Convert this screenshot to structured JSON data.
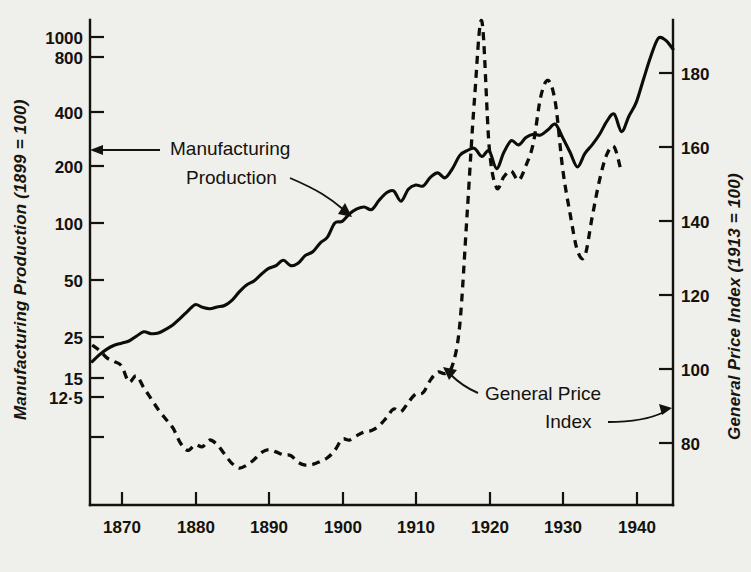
{
  "chart_data": {
    "type": "line",
    "title": "",
    "xlabel": "",
    "ylabel": "Manufacturing Production (1899 = 100)",
    "y2label": "General Price Index (1913 = 100)",
    "xlim": [
      1865.7,
      1945.0
    ],
    "x_ticks": [
      1870,
      1880,
      1890,
      1900,
      1910,
      1920,
      1930,
      1940
    ],
    "x_tick_labels": [
      "1870",
      "1880",
      "1890",
      "1900",
      "1910",
      "1920",
      "1930",
      "1940"
    ],
    "y_scale": "log",
    "ylim": [
      9.0,
      1300
    ],
    "y_ticks": [
      12.5,
      15,
      25,
      50,
      100,
      200,
      400,
      800,
      1000
    ],
    "y_tick_labels": [
      "12·5",
      "15",
      "25",
      "50",
      "100",
      "200",
      "400",
      "800",
      "1000"
    ],
    "y2_scale": "linear",
    "y2lim": [
      70,
      200
    ],
    "y2_ticks": [
      80,
      100,
      120,
      140,
      160,
      180
    ],
    "y2_tick_labels": [
      "80",
      "100",
      "120",
      "140",
      "160",
      "180"
    ],
    "grid": false,
    "legend": "annotated-inline",
    "series": [
      {
        "name": "Manufacturing Production",
        "axis": "left",
        "style": "solid",
        "x": [
          1866,
          1867,
          1868,
          1869,
          1870,
          1871,
          1872,
          1873,
          1874,
          1875,
          1876,
          1877,
          1878,
          1879,
          1880,
          1881,
          1882,
          1883,
          1884,
          1885,
          1886,
          1887,
          1888,
          1889,
          1890,
          1891,
          1892,
          1893,
          1894,
          1895,
          1896,
          1897,
          1898,
          1899,
          1900,
          1901,
          1902,
          1903,
          1904,
          1905,
          1906,
          1907,
          1908,
          1909,
          1910,
          1911,
          1912,
          1913,
          1914,
          1915,
          1916,
          1917,
          1918,
          1919,
          1920,
          1921,
          1922,
          1923,
          1924,
          1925,
          1926,
          1927,
          1928,
          1929,
          1930,
          1931,
          1932,
          1933,
          1934,
          1935,
          1936,
          1937,
          1938,
          1939,
          1940,
          1941,
          1942,
          1943,
          1944,
          1945
        ],
        "y": [
          18.0,
          19.6,
          21.0,
          22.0,
          22.6,
          23.2,
          24.6,
          26.0,
          25.4,
          25.6,
          26.8,
          28.4,
          30.8,
          33.6,
          36.4,
          35.2,
          34.6,
          35.4,
          36.0,
          38.4,
          42.6,
          46.4,
          48.8,
          53.0,
          57.0,
          59.0,
          63.0,
          59.0,
          60.8,
          67.0,
          70.0,
          78.0,
          84.0,
          100.0,
          102.0,
          112.0,
          119.0,
          122.0,
          118.0,
          132.0,
          145.0,
          149.0,
          131.0,
          152.0,
          160.0,
          158.0,
          176.0,
          186.0,
          175.0,
          196.0,
          231.0,
          245.0,
          252.0,
          228.0,
          244.0,
          196.0,
          240.0,
          277.0,
          263.0,
          288.0,
          300.0,
          297.0,
          317.0,
          340.0,
          287.0,
          240.0,
          200.0,
          236.0,
          263.0,
          299.0,
          352.0,
          385.0,
          310.0,
          375.0,
          445.0,
          595.0,
          790.0,
          985.0,
          960.0,
          860.0
        ]
      },
      {
        "name": "General Price Index",
        "axis": "right",
        "style": "dashed",
        "x": [
          1866,
          1867,
          1868,
          1869,
          1870,
          1871,
          1872,
          1873,
          1874,
          1875,
          1876,
          1877,
          1878,
          1879,
          1880,
          1881,
          1882,
          1883,
          1884,
          1885,
          1886,
          1887,
          1888,
          1889,
          1890,
          1891,
          1892,
          1893,
          1894,
          1895,
          1896,
          1897,
          1898,
          1899,
          1900,
          1901,
          1902,
          1903,
          1904,
          1905,
          1906,
          1907,
          1908,
          1909,
          1910,
          1911,
          1912,
          1913,
          1914,
          1915,
          1916,
          1917,
          1918,
          1919,
          1920,
          1921,
          1922,
          1923,
          1924,
          1925,
          1926,
          1927,
          1928,
          1929,
          1930,
          1931,
          1932,
          1933,
          1934,
          1935,
          1936,
          1937,
          1938
        ],
        "y": [
          106.5,
          105.0,
          103.0,
          102.0,
          100.8,
          96.5,
          98.2,
          95.0,
          92.0,
          89.0,
          86.5,
          84.0,
          80.0,
          78.0,
          79.5,
          79.0,
          80.8,
          79.5,
          77.0,
          74.5,
          73.2,
          74.0,
          75.5,
          77.4,
          78.2,
          77.6,
          76.8,
          76.6,
          74.8,
          74.0,
          74.2,
          75.0,
          76.0,
          78.0,
          81.0,
          80.8,
          82.0,
          83.0,
          83.4,
          84.6,
          86.8,
          89.2,
          88.5,
          91.0,
          93.2,
          93.6,
          97.0,
          99.2,
          98.8,
          101.0,
          112.0,
          142.0,
          173.0,
          194.0,
          160.0,
          149.0,
          152.0,
          153.5,
          151.0,
          155.0,
          161.0,
          173.5,
          178.0,
          172.0,
          154.0,
          142.0,
          132.0,
          130.5,
          141.0,
          151.0,
          158.0,
          160.0,
          153.0
        ]
      }
    ],
    "annotations": [
      {
        "name": "manufacturing-production-label",
        "text_lines": [
          "Manufacturing",
          "Production"
        ],
        "points_to": "solid-series"
      },
      {
        "name": "general-price-index-label",
        "text_lines": [
          "General  Price",
          "Index"
        ],
        "points_to": "dashed-series"
      }
    ]
  },
  "axes": {
    "left_title": "Manufacturing Production (1899 = 100)",
    "right_title": "General Price Index (1913 = 100)"
  },
  "labels": {
    "manufacturing_line1": "Manufacturing",
    "manufacturing_line2": "Production",
    "price_line1": "General  Price",
    "price_line2": "Index"
  },
  "colors": {
    "ink": "#14120d",
    "paper": "#efefeb"
  }
}
